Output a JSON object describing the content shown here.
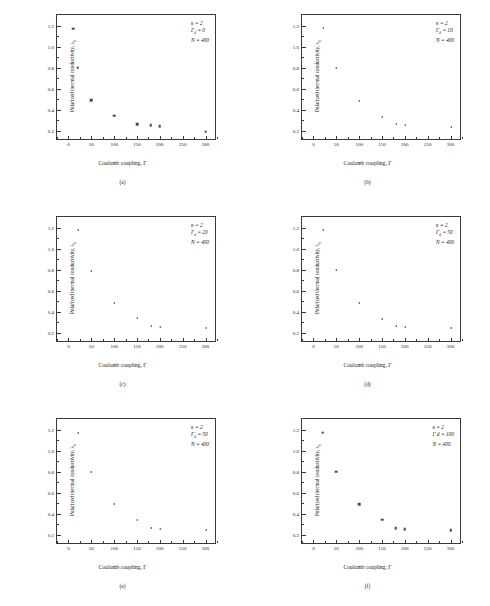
{
  "figure": {
    "width": 490,
    "height": 606,
    "marker_color": "#4a4a4a",
    "axis_color": "#3a3a3a"
  },
  "axes": {
    "xlabel": "Coulomb coupling, Γ",
    "ylabel_main": "Polarized thermal conductivity, λ",
    "ylabel_sub": "b",
    "xticks": [
      0,
      50,
      100,
      150,
      200,
      250,
      300
    ],
    "xticklabels": [
      "0",
      "50",
      "100",
      "150",
      "200",
      "250",
      "300"
    ],
    "yticks": [
      0.2,
      0.4,
      0.6,
      0.8,
      1.0,
      1.2
    ],
    "yticklabels": [
      "0.2",
      "0.4",
      "0.6",
      "0.8",
      "1.0",
      "1.2"
    ],
    "xlim": [
      -25,
      325
    ],
    "ylim": [
      0.1,
      1.3
    ]
  },
  "chart_data": [
    {
      "type": "scatter",
      "panel": "(a)",
      "marker": "square",
      "title": "",
      "xlabel": "Coulomb coupling, Γ",
      "ylabel": "Polarized thermal conductivity, λ_b",
      "xlim": [
        -25,
        325
      ],
      "ylim": [
        0.1,
        1.3
      ],
      "grid": false,
      "annotations": [
        "κ = 2",
        "Γ = 0",
        "N = 400"
      ],
      "annotation_kappa": "κ = 2",
      "annotation_gamma_label": "Γ",
      "annotation_gamma_sub": "d",
      "annotation_gamma_value": "= 0",
      "annotation_n": "N = 400",
      "x": [
        10,
        20,
        50,
        100,
        150,
        180,
        200,
        300
      ],
      "y": [
        1.17,
        0.8,
        0.49,
        0.34,
        0.26,
        0.25,
        0.24,
        0.19
      ]
    },
    {
      "type": "scatter",
      "panel": "(b)",
      "marker": "triangle-left",
      "title": "",
      "xlabel": "Coulomb coupling, Γ",
      "ylabel": "Polarized thermal conductivity, λ_b",
      "xlim": [
        -25,
        325
      ],
      "ylim": [
        0.1,
        1.3
      ],
      "grid": false,
      "annotations": [
        "κ = 2",
        "Γ = 10",
        "N = 400"
      ],
      "annotation_kappa": "κ = 2",
      "annotation_gamma_label": "Γ",
      "annotation_gamma_sub": "d",
      "annotation_gamma_value": "= 10",
      "annotation_n": "N = 400",
      "x": [
        20,
        50,
        100,
        150,
        180,
        200,
        300
      ],
      "y": [
        1.18,
        0.8,
        0.48,
        0.33,
        0.26,
        0.25,
        0.23,
        0.19
      ]
    },
    {
      "type": "scatter",
      "panel": "(c)",
      "marker": "triangle-left",
      "title": "",
      "xlabel": "Coulomb coupling, Γ",
      "ylabel": "Polarized thermal conductivity, λ_b",
      "xlim": [
        -25,
        325
      ],
      "ylim": [
        0.1,
        1.3
      ],
      "grid": false,
      "annotations": [
        "κ = 2",
        "Γ = 20",
        "N = 400"
      ],
      "annotation_kappa": "κ = 2",
      "annotation_gamma_label": "Γ",
      "annotation_gamma_sub": "d",
      "annotation_gamma_value": "= 20",
      "annotation_n": "N = 400",
      "x": [
        20,
        50,
        100,
        150,
        180,
        200,
        300
      ],
      "y": [
        1.18,
        0.79,
        0.48,
        0.34,
        0.26,
        0.25,
        0.24,
        0.2
      ]
    },
    {
      "type": "scatter",
      "panel": "(d)",
      "marker": "triangle-left",
      "title": "",
      "xlabel": "Coulomb coupling, Γ",
      "ylabel": "Polarized thermal conductivity, λ_b",
      "xlim": [
        -25,
        325
      ],
      "ylim": [
        0.1,
        1.3
      ],
      "grid": false,
      "annotations": [
        "κ = 2",
        "Γ = 50",
        "N = 400"
      ],
      "annotation_kappa": "κ = 2",
      "annotation_gamma_label": "Γ",
      "annotation_gamma_sub": "d",
      "annotation_gamma_value": "= 50",
      "annotation_n": "N = 400",
      "x": [
        20,
        50,
        100,
        150,
        180,
        200,
        300
      ],
      "y": [
        1.18,
        0.8,
        0.48,
        0.33,
        0.26,
        0.25,
        0.24,
        0.19
      ]
    },
    {
      "type": "scatter",
      "panel": "(e)",
      "marker": "triangle-left",
      "title": "",
      "xlabel": "Coulomb coupling, Γ",
      "ylabel": "Polarized thermal conductivity, λ_b",
      "xlim": [
        -25,
        325
      ],
      "ylim": [
        0.1,
        1.3
      ],
      "grid": false,
      "annotations": [
        "κ = 2",
        "Γ = 50",
        "N = 400"
      ],
      "annotation_kappa": "κ = 2",
      "annotation_gamma_label": "Γ",
      "annotation_gamma_sub": "d",
      "annotation_gamma_value": "= 50",
      "annotation_n": "N = 400",
      "x": [
        20,
        50,
        100,
        150,
        180,
        200,
        300
      ],
      "y": [
        1.17,
        0.8,
        0.49,
        0.34,
        0.26,
        0.25,
        0.24,
        0.19
      ]
    },
    {
      "type": "scatter",
      "panel": "(f)",
      "marker": "square",
      "title": "",
      "xlabel": "Coulomb coupling, Γ",
      "ylabel": "Polarized thermal conductivity, λ_b",
      "xlim": [
        -25,
        325
      ],
      "ylim": [
        0.1,
        1.3
      ],
      "grid": false,
      "annotations": [
        "κ = 2",
        "Γ d = 100",
        "N = 400"
      ],
      "annotation_kappa": "κ = 2",
      "annotation_gamma_label": "Γ d",
      "annotation_gamma_sub": "",
      "annotation_gamma_value": "= 100",
      "annotation_n": "N = 400",
      "x": [
        20,
        50,
        100,
        150,
        180,
        200,
        300
      ],
      "y": [
        1.17,
        0.8,
        0.49,
        0.34,
        0.26,
        0.25,
        0.24,
        0.19
      ]
    }
  ]
}
